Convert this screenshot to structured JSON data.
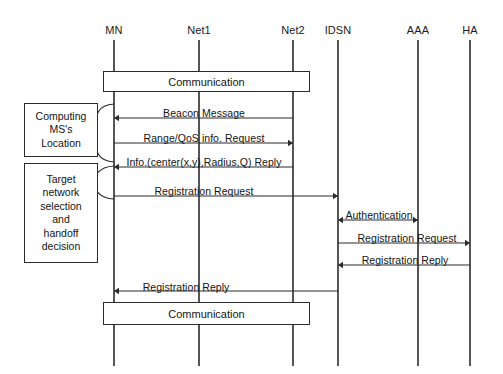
{
  "diagram": {
    "background_color": "#ffffff",
    "line_color": "#2b2b2b",
    "text_color": "#141414",
    "width": 503,
    "height": 374
  },
  "lifelines": [
    {
      "id": "mn",
      "label": "MN",
      "x": 114,
      "label_y": 30,
      "top": 40,
      "bottom": 366
    },
    {
      "id": "net1",
      "label": "Net1",
      "x": 199,
      "label_y": 30,
      "top": 40,
      "bottom": 366
    },
    {
      "id": "net2",
      "label": "Net2",
      "x": 293,
      "label_y": 30,
      "top": 40,
      "bottom": 366
    },
    {
      "id": "idsn",
      "label": "IDSN",
      "x": 338,
      "label_y": 30,
      "top": 40,
      "bottom": 366
    },
    {
      "id": "aaa",
      "label": "AAA",
      "x": 418,
      "label_y": 30,
      "top": 40,
      "bottom": 366
    },
    {
      "id": "ha",
      "label": "HA",
      "x": 470,
      "label_y": 30,
      "top": 40,
      "bottom": 366
    }
  ],
  "phase_boxes": [
    {
      "id": "computing-location",
      "lines": [
        "Computing",
        "MS's",
        "Location"
      ],
      "text": "Computing MS's Location",
      "x": 24,
      "y": 103,
      "width": 74,
      "height": 54
    },
    {
      "id": "handoff-decision",
      "lines": [
        "Target",
        "network",
        "selection",
        "and",
        "handoff",
        "decision"
      ],
      "text": "Target network selection and handoff decision",
      "x": 24,
      "y": 163,
      "width": 74,
      "height": 100
    }
  ],
  "activity_boxes": [
    {
      "id": "communication-top",
      "label": "Communication",
      "x": 103,
      "y": 71,
      "width": 207,
      "height": 21
    },
    {
      "id": "communication-bottom",
      "label": "Communication",
      "x": 103,
      "y": 302,
      "width": 207,
      "height": 23
    }
  ],
  "braces": [
    {
      "id": "brace-computing",
      "x": 100,
      "y_top": 104,
      "y_bottom": 162,
      "tip_x": 114
    },
    {
      "id": "brace-handoff",
      "x": 100,
      "y_top": 166,
      "y_bottom": 199,
      "tip_x": 114
    }
  ],
  "messages": [
    {
      "id": "beacon-message",
      "label": "Beacon Message",
      "from": "net2",
      "to": "mn",
      "x1": 293,
      "x2": 114,
      "y": 118,
      "direction": "left",
      "label_x": 204,
      "label_y": 107
    },
    {
      "id": "range-qos-request",
      "label": "Range/QoS info. Request",
      "from": "mn",
      "to": "net2",
      "x1": 114,
      "x2": 293,
      "y": 143,
      "direction": "right",
      "label_x": 204,
      "label_y": 132
    },
    {
      "id": "info-reply",
      "label": "Info.(center(x,y),Radius,Q) Reply",
      "from": "net2",
      "to": "mn",
      "x1": 293,
      "x2": 114,
      "y": 167,
      "direction": "left",
      "label_x": 204,
      "label_y": 156
    },
    {
      "id": "registration-request-mn-idsn",
      "label": "Registration Request",
      "from": "mn",
      "to": "idsn",
      "x1": 114,
      "x2": 338,
      "y": 196,
      "direction": "right",
      "label_x": 204,
      "label_y": 185
    },
    {
      "id": "authentication",
      "label": "Authentication",
      "from": "idsn",
      "to": "aaa",
      "x1": 338,
      "x2": 418,
      "y": 220,
      "direction": "both",
      "label_x": 379,
      "label_y": 209
    },
    {
      "id": "registration-request-idsn-ha",
      "label": "Registration Request",
      "from": "idsn",
      "to": "ha",
      "x1": 338,
      "x2": 470,
      "y": 243,
      "direction": "right",
      "label_x": 407,
      "label_y": 232
    },
    {
      "id": "registration-reply-ha-idsn",
      "label": "Registration Reply",
      "from": "ha",
      "to": "idsn",
      "x1": 470,
      "x2": 338,
      "y": 265,
      "direction": "left",
      "label_x": 405,
      "label_y": 254
    },
    {
      "id": "registration-reply-idsn-mn",
      "label": "Registration Reply",
      "from": "idsn",
      "to": "mn",
      "x1": 338,
      "x2": 114,
      "y": 291,
      "direction": "left",
      "label_x": 186,
      "label_y": 281
    }
  ]
}
